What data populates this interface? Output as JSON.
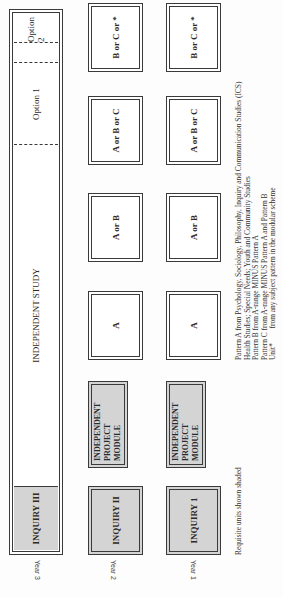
{
  "diagram": {
    "rows": [
      {
        "year_label": "Year 3",
        "requisite": "INQUIRY III",
        "independent_study": "INDEPENDENT STUDY",
        "options": [
          "Option 1",
          "Option 2"
        ]
      },
      {
        "year_label": "Year 2",
        "requisite": "INQUIRY II",
        "project_module": "INDEPENDENT PROJECT MODULE",
        "cells": [
          "A",
          "A or B",
          "A or B or C",
          "B or C or *"
        ]
      },
      {
        "year_label": "Year 1",
        "requisite": "INQUIRY 1",
        "project_module": "INDEPENDENT PROJECT MODULE",
        "cells": [
          "A",
          "A or B",
          "A or B or C",
          "B or C or *"
        ]
      }
    ],
    "project_module_lines": [
      "INDEPENDENT",
      "PROJECT",
      "MODULE"
    ],
    "note": "Requisite units shown shaded",
    "legend": [
      "Pattern A from Psychology, Sociology, Philosophy, Inquiry and Communication Studies (ICS)",
      "Health Studies; Special Needs; Youth and Community Studies",
      "Pattern B from A-range MINUS Pattern A",
      "Pattern C from A-range MINUS Pattern A and Pattern B",
      "Unit*        from any subject pattern in the modular scheme"
    ],
    "colors": {
      "shaded": "#d4d4d4",
      "line": "#3a3a3a"
    }
  }
}
